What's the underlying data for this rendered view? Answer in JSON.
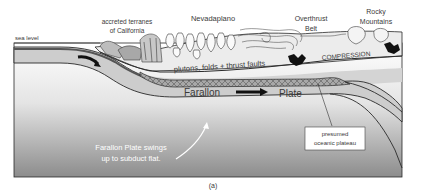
{
  "figure": {
    "caption": "(a)",
    "labels": {
      "sea_level": "sea level",
      "accreted_line1": "accreted terranes",
      "accreted_line2": "of California",
      "nevadaplano": "Nevadaplano",
      "overthrust_line1": "Overthrust",
      "overthrust_line2": "Belt",
      "rocky_line1": "Rocky",
      "rocky_line2": "Mountains",
      "compression": "COMPRESSION",
      "plutons": "plutons, folds + thrust faults",
      "farallon": "Farallon",
      "plate": "Plate",
      "plateau_line1": "presumed",
      "plateau_line2": "oceanic plateau",
      "swing_line1": "Farallon Plate swings",
      "swing_line2": "up to subduct flat."
    },
    "colors": {
      "plate_fill": "#cfcfcf",
      "crust_fill": "#e6e6e6",
      "mantle_top": "#ffffff",
      "mantle_bottom": "#8a8a8a",
      "outline": "#2a2a2a",
      "plateau_fill": "#9a9a9a",
      "label_text": "#3a3a3a",
      "white_text": "#ffffff"
    }
  }
}
